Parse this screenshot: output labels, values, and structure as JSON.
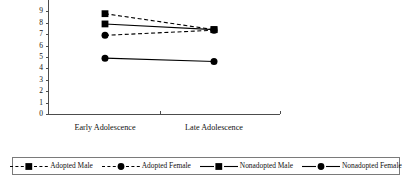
{
  "chart_data": {
    "type": "line",
    "title": "",
    "subtitle": "",
    "xlabel": "",
    "ylabel": "",
    "categories": [
      "Early Adolescence",
      "Late Adolescence"
    ],
    "ylim": [
      0,
      9
    ],
    "ytick_labels": [
      "0",
      "1",
      "2",
      "3",
      "4",
      "5",
      "6",
      "7",
      "8",
      "9"
    ],
    "ytick_values": [
      0,
      1,
      2,
      3,
      4,
      5,
      6,
      7,
      8,
      9
    ],
    "grid": false,
    "legend_position": "bottom",
    "note": "Plot is cropped at the top edge; the Adopted Male early-adolescence marker is partially clipped.",
    "series": [
      {
        "name": "Adopted Male",
        "marker": "square",
        "linestyle": "dashed",
        "color": "#000000",
        "values": [
          8.8,
          7.4
        ]
      },
      {
        "name": "Adopted Female",
        "marker": "circle",
        "linestyle": "dashed",
        "color": "#000000",
        "values": [
          6.9,
          7.35
        ]
      },
      {
        "name": "Nonadopted Male",
        "marker": "square",
        "linestyle": "solid",
        "color": "#000000",
        "values": [
          7.9,
          7.4
        ]
      },
      {
        "name": "Nonadopted Female",
        "marker": "circle",
        "linestyle": "solid",
        "color": "#000000",
        "values": [
          4.9,
          4.6
        ]
      }
    ]
  },
  "legend": {
    "entries": [
      {
        "label": "Adopted Male",
        "marker": "square",
        "linestyle": "dashed"
      },
      {
        "label": "Adopted Female",
        "marker": "circle",
        "linestyle": "dashed"
      },
      {
        "label": "Nonadopted Male",
        "marker": "square",
        "linestyle": "solid"
      },
      {
        "label": "Nonadopted Female",
        "marker": "circle",
        "linestyle": "solid"
      }
    ]
  },
  "colors": {
    "axis": "#4c4c4c",
    "series": "#000000",
    "legend_border": "#7a7a7a",
    "background": "#ffffff"
  }
}
